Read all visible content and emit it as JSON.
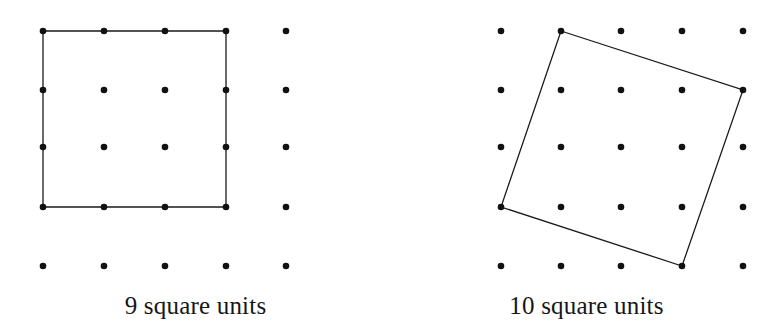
{
  "figure": {
    "background_color": "#ffffff",
    "dot_color": "#111111",
    "line_color": "#1a1a1a",
    "text_color": "#161616",
    "dot_radius": 3.3,
    "line_width": 1.3,
    "grid": {
      "columns": 5,
      "rows": 5,
      "x_positions": [
        43,
        104,
        165,
        226,
        286
      ],
      "y_positions": [
        31,
        90,
        147,
        207,
        266
      ]
    },
    "grid_right": {
      "columns": 5,
      "rows": 5,
      "x_positions": [
        110,
        170,
        230,
        291,
        352
      ],
      "y_positions": [
        31,
        90,
        147,
        207,
        266
      ]
    },
    "panels": [
      {
        "id": "left-panel",
        "name": "axis-aligned-square",
        "caption": "9 square units",
        "area_value": 9,
        "area_units": "square units",
        "shape_type": "polygon",
        "vertex_lattice_points": [
          [
            0,
            0
          ],
          [
            3,
            0
          ],
          [
            3,
            3
          ],
          [
            0,
            3
          ]
        ],
        "vertex_pixels": [
          [
            43,
            31
          ],
          [
            226,
            31
          ],
          [
            226,
            207
          ],
          [
            43,
            207
          ]
        ],
        "side_length_units": 3,
        "orientation": "axis-aligned"
      },
      {
        "id": "right-panel",
        "name": "tilted-square",
        "caption": "10 square units",
        "area_value": 10,
        "area_units": "square units",
        "shape_type": "polygon",
        "vertex_lattice_points": [
          [
            1,
            0
          ],
          [
            4,
            1
          ],
          [
            3,
            4
          ],
          [
            0,
            3
          ]
        ],
        "vertex_pixels": [
          [
            170,
            31
          ],
          [
            352,
            90
          ],
          [
            291,
            266
          ],
          [
            110,
            207
          ]
        ],
        "side_length_units": 3.1623,
        "orientation": "tilted"
      }
    ]
  }
}
